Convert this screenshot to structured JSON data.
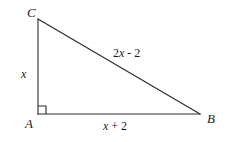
{
  "figure": {
    "type": "right-triangle-diagram",
    "background_color": "#ffffff",
    "stroke_color": "#2b2b2b",
    "text_color": "#1a1a1a",
    "vertices": {
      "C": {
        "label": "C",
        "x": 38,
        "y": 19
      },
      "A": {
        "label": "A",
        "x": 38,
        "y": 114
      },
      "B": {
        "label": "B",
        "x": 200,
        "y": 114
      }
    },
    "right_angle": {
      "at_vertex": "A",
      "marker_size": 8
    },
    "sides": {
      "leg_vertical": {
        "label_prefix": "",
        "label_var": "x",
        "label_suffix": "",
        "from": "A",
        "to": "C"
      },
      "leg_horizontal": {
        "label_prefix": "",
        "label_var": "x",
        "label_suffix": " + 2",
        "from": "A",
        "to": "B"
      },
      "hypotenuse": {
        "label_prefix": "2",
        "label_var": "x",
        "label_suffix": " - 2",
        "from": "C",
        "to": "B"
      }
    }
  }
}
